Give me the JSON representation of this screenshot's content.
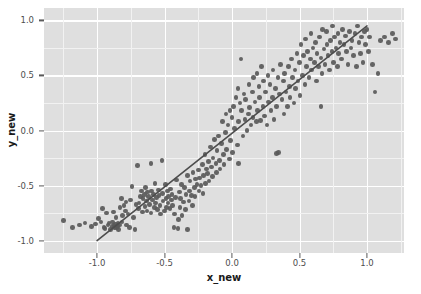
{
  "chart_data": {
    "type": "scatter",
    "title": "",
    "xlabel": "x_new",
    "ylabel": "y_new",
    "xlim": [
      -1.393,
      1.274
    ],
    "ylim": [
      -1.113,
      1.113
    ],
    "xticks": [
      -1.0,
      -0.5,
      0.0,
      0.5,
      1.0
    ],
    "xticklabels": [
      "-1.0",
      "-0.5",
      "0.0",
      "0.5",
      "1.0"
    ],
    "yticks": [
      -1.0,
      -0.5,
      0.0,
      0.5,
      1.0
    ],
    "yticklabels": [
      "-1.0",
      "-0.5",
      "0.0",
      "0.5",
      "1.0"
    ],
    "grid": true,
    "grid_major_color": "#ffffff",
    "grid_minor_color": "#f2f2f2",
    "panel_background": "#dfdfdf",
    "point_color": "#595959",
    "point_size": 4.6,
    "legend": null,
    "series": [
      {
        "name": "observations",
        "type": "scatter",
        "n_points": 285,
        "x": [
          -1.25,
          -1.18,
          -1.13,
          -1.09,
          -1.04,
          -1.01,
          -0.99,
          -0.97,
          -0.96,
          -0.95,
          -0.94,
          -0.93,
          -0.92,
          -0.91,
          -0.9,
          -0.89,
          -0.885,
          -0.88,
          -0.875,
          -0.87,
          -0.865,
          -0.86,
          -0.855,
          -0.85,
          -0.845,
          -0.84,
          -0.835,
          -0.83,
          -0.82,
          -0.815,
          -0.81,
          -0.8,
          -0.79,
          -0.785,
          -0.78,
          -0.77,
          -0.76,
          -0.75,
          -0.74,
          -0.73,
          -0.72,
          -0.71,
          -0.7,
          -0.695,
          -0.69,
          -0.68,
          -0.67,
          -0.665,
          -0.66,
          -0.65,
          -0.645,
          -0.64,
          -0.635,
          -0.63,
          -0.625,
          -0.62,
          -0.61,
          -0.6,
          -0.595,
          -0.59,
          -0.58,
          -0.575,
          -0.57,
          -0.565,
          -0.56,
          -0.55,
          -0.545,
          -0.54,
          -0.535,
          -0.53,
          -0.52,
          -0.515,
          -0.51,
          -0.5,
          -0.495,
          -0.49,
          -0.485,
          -0.48,
          -0.475,
          -0.47,
          -0.46,
          -0.455,
          -0.45,
          -0.445,
          -0.44,
          -0.43,
          -0.425,
          -0.42,
          -0.41,
          -0.4,
          -0.395,
          -0.39,
          -0.385,
          -0.38,
          -0.375,
          -0.37,
          -0.36,
          -0.35,
          -0.345,
          -0.34,
          -0.33,
          -0.32,
          -0.315,
          -0.31,
          -0.3,
          -0.295,
          -0.29,
          -0.28,
          -0.275,
          -0.27,
          -0.26,
          -0.25,
          -0.245,
          -0.24,
          -0.23,
          -0.22,
          -0.215,
          -0.21,
          -0.2,
          -0.195,
          -0.19,
          -0.18,
          -0.175,
          -0.17,
          -0.16,
          -0.15,
          -0.145,
          -0.14,
          -0.13,
          -0.12,
          -0.115,
          -0.11,
          -0.1,
          -0.095,
          -0.09,
          -0.08,
          -0.07,
          -0.065,
          -0.06,
          -0.05,
          -0.045,
          -0.04,
          -0.03,
          -0.02,
          -0.015,
          -0.01,
          0.0,
          0.005,
          0.01,
          0.02,
          0.03,
          0.04,
          0.045,
          0.05,
          0.06,
          0.065,
          0.07,
          0.08,
          0.09,
          0.095,
          0.1,
          0.11,
          0.12,
          0.125,
          0.13,
          0.14,
          0.15,
          0.155,
          0.16,
          0.17,
          0.18,
          0.185,
          0.19,
          0.2,
          0.205,
          0.21,
          0.22,
          0.23,
          0.235,
          0.24,
          0.25,
          0.26,
          0.265,
          0.27,
          0.28,
          0.29,
          0.3,
          0.305,
          0.31,
          0.32,
          0.33,
          0.34,
          0.345,
          0.35,
          0.36,
          0.37,
          0.38,
          0.385,
          0.39,
          0.4,
          0.41,
          0.42,
          0.425,
          0.43,
          0.44,
          0.45,
          0.46,
          0.465,
          0.47,
          0.48,
          0.49,
          0.5,
          0.505,
          0.51,
          0.52,
          0.53,
          0.54,
          0.545,
          0.55,
          0.56,
          0.57,
          0.58,
          0.585,
          0.59,
          0.6,
          0.61,
          0.62,
          0.625,
          0.63,
          0.64,
          0.65,
          0.66,
          0.665,
          0.67,
          0.68,
          0.69,
          0.7,
          0.705,
          0.71,
          0.72,
          0.73,
          0.74,
          0.745,
          0.75,
          0.76,
          0.77,
          0.78,
          0.785,
          0.79,
          0.8,
          0.81,
          0.82,
          0.83,
          0.84,
          0.85,
          0.86,
          0.87,
          0.88,
          0.89,
          0.9,
          0.91,
          0.92,
          0.93,
          0.94,
          0.95,
          0.96,
          0.97,
          0.98,
          0.99,
          1.0,
          1.01,
          1.02,
          1.04,
          1.06,
          1.08,
          1.1,
          1.13,
          1.16,
          1.19,
          1.21,
          -0.6,
          -0.33,
          0.05,
          0.33,
          0.66
        ],
        "y": [
          -0.82,
          -0.88,
          -0.86,
          -0.84,
          -0.87,
          -0.85,
          -0.8,
          -0.83,
          -0.71,
          -0.88,
          -0.89,
          -0.75,
          -0.86,
          -0.84,
          -0.9,
          -0.87,
          -0.83,
          -0.74,
          -0.86,
          -0.88,
          -0.85,
          -0.79,
          -0.88,
          -0.87,
          -0.84,
          -0.9,
          -0.86,
          -0.7,
          -0.62,
          -0.83,
          -0.77,
          -0.68,
          -0.73,
          -0.65,
          -0.86,
          -0.76,
          -0.88,
          -0.63,
          -0.51,
          -0.79,
          -0.9,
          -0.67,
          -0.32,
          -0.71,
          -0.66,
          -0.6,
          -0.55,
          -0.74,
          -0.62,
          -0.58,
          -0.69,
          -0.52,
          -0.64,
          -0.73,
          -0.56,
          -0.6,
          -0.67,
          -0.75,
          -0.55,
          -0.63,
          -0.58,
          -0.7,
          -0.48,
          -0.66,
          -0.61,
          -0.72,
          -0.54,
          -0.59,
          -0.68,
          -0.76,
          -0.27,
          -0.57,
          -0.64,
          -0.73,
          -0.49,
          -0.62,
          -0.7,
          -0.55,
          -0.66,
          -0.6,
          -0.71,
          -0.53,
          -0.63,
          -0.58,
          -0.68,
          -0.88,
          -0.76,
          -0.61,
          -0.45,
          -0.89,
          -0.81,
          -0.56,
          -0.7,
          -0.62,
          -0.49,
          -0.77,
          -0.65,
          -0.52,
          -0.72,
          -0.58,
          -0.41,
          -0.64,
          -0.55,
          -0.46,
          -0.59,
          -0.68,
          -0.38,
          -0.52,
          -0.6,
          -0.44,
          -0.49,
          -0.36,
          -0.55,
          -0.43,
          -0.5,
          -0.31,
          -0.57,
          -0.41,
          -0.22,
          -0.48,
          -0.35,
          -0.39,
          -0.28,
          -0.46,
          -0.15,
          -0.33,
          -0.42,
          -0.25,
          -0.08,
          -0.3,
          -0.38,
          -0.18,
          -0.05,
          -0.27,
          -0.35,
          -0.12,
          0.08,
          -0.22,
          -0.31,
          -0.02,
          0.15,
          -0.17,
          0.05,
          -0.26,
          0.18,
          -0.09,
          0.12,
          -0.2,
          0.22,
          0.02,
          0.3,
          -0.13,
          0.38,
          0.08,
          0.25,
          0.65,
          0.18,
          -0.05,
          0.33,
          0.1,
          0.28,
          0.0,
          0.15,
          0.42,
          0.21,
          0.05,
          0.35,
          0.12,
          0.48,
          0.26,
          0.08,
          0.52,
          0.18,
          0.4,
          0.3,
          0.09,
          0.58,
          0.22,
          0.45,
          0.13,
          0.35,
          0.05,
          0.5,
          0.26,
          0.42,
          0.18,
          0.3,
          0.55,
          0.1,
          0.38,
          0.22,
          0.48,
          -0.2,
          0.33,
          0.6,
          0.28,
          0.45,
          0.15,
          0.52,
          0.35,
          0.22,
          0.58,
          0.4,
          0.3,
          0.65,
          0.48,
          0.25,
          0.55,
          0.38,
          0.7,
          0.45,
          0.62,
          0.32,
          0.78,
          0.5,
          0.68,
          0.42,
          0.83,
          0.58,
          0.72,
          0.48,
          0.65,
          0.88,
          0.55,
          0.75,
          0.62,
          0.8,
          0.45,
          0.7,
          0.58,
          0.85,
          0.66,
          0.52,
          0.92,
          0.74,
          0.6,
          0.9,
          0.78,
          0.68,
          0.55,
          0.82,
          0.72,
          0.95,
          0.62,
          0.85,
          0.75,
          0.58,
          0.88,
          0.7,
          0.8,
          0.65,
          0.92,
          0.78,
          0.86,
          0.72,
          0.6,
          0.9,
          0.75,
          0.82,
          0.68,
          0.88,
          0.58,
          0.95,
          0.8,
          0.7,
          0.85,
          0.62,
          0.9,
          0.78,
          0.92,
          0.72,
          0.85,
          0.6,
          0.35,
          0.52,
          0.82,
          0.85,
          0.8,
          0.88,
          0.83,
          -0.3,
          -0.9,
          -0.3,
          -0.21,
          0.22
        ]
      },
      {
        "name": "fit-line",
        "type": "line",
        "x": [
          -1.0,
          1.0
        ],
        "y": [
          -1.0,
          0.95
        ],
        "color": "#4d4d4d",
        "width": 1.6
      }
    ]
  },
  "axes": {
    "x_title": "x_new",
    "y_title": "y_new"
  }
}
